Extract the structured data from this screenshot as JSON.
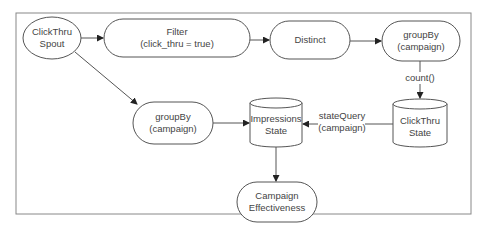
{
  "nodes": {
    "spout": {
      "line1": "ClickThru",
      "line2": "Spout",
      "shape": "ellipse"
    },
    "filter": {
      "line1": "Filter",
      "line2": "(click_thru = true)",
      "shape": "rounded-rect"
    },
    "distinct": {
      "line1": "Distinct",
      "shape": "rounded-rect"
    },
    "groupby_top": {
      "line1": "groupBy",
      "line2": "(campaign)",
      "shape": "rounded-rect"
    },
    "clickthru_state": {
      "line1": "ClickThru",
      "line2": "State",
      "shape": "cylinder"
    },
    "impressions_state": {
      "line1": "Impressions",
      "line2": "State",
      "shape": "cylinder"
    },
    "groupby_left": {
      "line1": "groupBy",
      "line2": "(campaign)",
      "shape": "rounded-rect"
    },
    "campaign_effectiveness": {
      "line1": "Campaign",
      "line2": "Effectiveness",
      "shape": "rounded-rect"
    }
  },
  "edges": {
    "count": {
      "label": "count()"
    },
    "state_query": {
      "line1": "stateQuery",
      "line2": "(campaign)"
    }
  },
  "colors": {
    "stroke": "#555555",
    "text": "#444444",
    "frame": "#888888"
  }
}
